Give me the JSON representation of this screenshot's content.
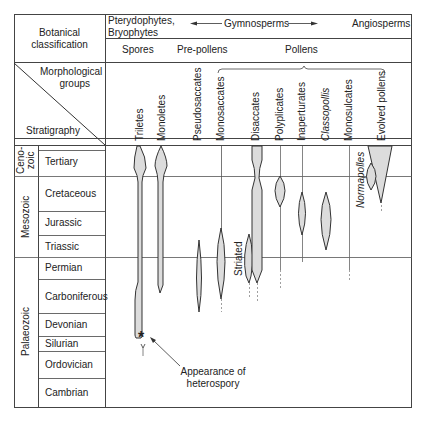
{
  "header": {
    "botanical_classification": [
      "Botanical",
      "classification"
    ],
    "pterydophytes": [
      "Pterydophytes,",
      "Bryophytes"
    ],
    "gymnosperms": "Gymnosperms",
    "angiosperms": "Angiosperms",
    "spores": "Spores",
    "pre_pollens": "Pre-pollens",
    "pollens": "Pollens",
    "morphological_groups": [
      "Morphological",
      "groups"
    ],
    "stratigraphy": "Stratigraphy"
  },
  "groups": [
    {
      "label": "Triletes",
      "italic": false
    },
    {
      "label": "Monoletes",
      "italic": false
    },
    {
      "label": "Pseudosaccates",
      "italic": false
    },
    {
      "label": "Monosaccates",
      "italic": false
    },
    {
      "label": "Disaccates",
      "italic": false
    },
    {
      "label": "Polyplicates",
      "italic": false
    },
    {
      "label": "Inaperturates",
      "italic": false
    },
    {
      "label": "Classopollis",
      "italic": true
    },
    {
      "label": "Monosulcates",
      "italic": false
    },
    {
      "label": "Evolved pollens",
      "italic": false
    }
  ],
  "eras": [
    {
      "label": "Ceno-\nzoic",
      "line1": "Ceno-",
      "line2": "zoic"
    },
    {
      "label": "Mesozoic"
    },
    {
      "label": "Palaeozoic"
    }
  ],
  "periods": [
    "Tertiary",
    "Cretaceous",
    "Jurassic",
    "Triassic",
    "Permian",
    "Carboniferous",
    "Devonian",
    "Silurian",
    "Ordovician",
    "Cambrian"
  ],
  "annotations": {
    "striated": "Striated",
    "normapolles": "Normapolles",
    "heterospory": [
      "Appearance of",
      "heterospory"
    ],
    "star": "*"
  },
  "colors": {
    "line": "#333333",
    "fill": "#dcdcdc",
    "grid": "#555555"
  }
}
